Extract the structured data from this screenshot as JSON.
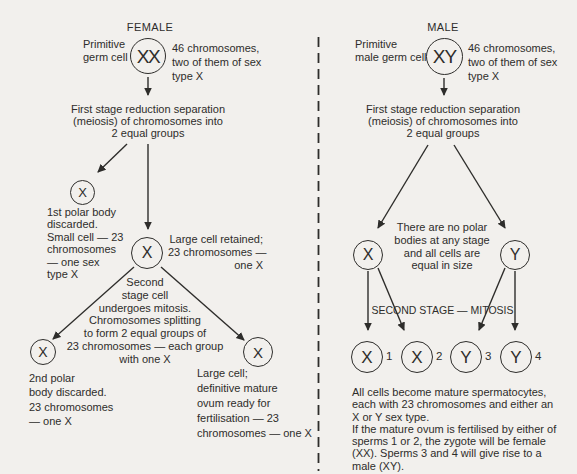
{
  "colors": {
    "ink": "#2e2d2b",
    "background": "#f2f0ed"
  },
  "female": {
    "title": "FEMALE",
    "primitive_label": "Primitive\ngerm cell",
    "germ_cell": "XX",
    "germ_note": "46 chromosomes,\ntwo of them of sex\ntype X",
    "first_stage": "First stage reduction separation\n(meiosis) of chromosomes into\n2 equal groups",
    "polar_body_1": {
      "symbol": "X",
      "note": "1st polar body\ndiscarded.\nSmall cell — 23\nchromosomes\n— one sex\ntype X"
    },
    "large_cell": {
      "symbol": "X",
      "note": "Large cell retained;\n23 chromosomes —\none X"
    },
    "second_stage": "Second\nstage cell\nundergoes mitosis.\nChromosomes splitting\nto form 2 equal groups of\n23 chromosomes — each group\nwith one X",
    "polar_body_2": {
      "symbol": "X",
      "note": "2nd polar\nbody discarded.\n23 chromosomes\n— one X"
    },
    "ovum": {
      "symbol": "X",
      "note": "Large cell;\ndefinitive mature\novum ready for\nfertilisation — 23\nchromosomes — one X"
    }
  },
  "male": {
    "title": "MALE",
    "primitive_label": "Primitive\nmale germ cell",
    "germ_cell": "XY",
    "germ_note": "46 chromosomes,\ntwo of them of sex\ntype X",
    "first_stage": "First stage reduction separation\n(meiosis) of chromosomes into\n2 equal groups",
    "x_cell": "X",
    "y_cell": "Y",
    "no_polar_note": "There are no polar\nbodies at any stage\nand all cells are\nequal in size",
    "second_stage_label": "SECOND STAGE — MITOSIS",
    "sperm_cells": [
      {
        "symbol": "X",
        "number": "1"
      },
      {
        "symbol": "X",
        "number": "2"
      },
      {
        "symbol": "Y",
        "number": "3"
      },
      {
        "symbol": "Y",
        "number": "4"
      }
    ],
    "bottom_note": "All cells become mature spermatocytes,\neach with 23 chromosomes and either an\nX or Y sex type.\nIf the mature ovum is fertilised by either of\nsperms 1 or 2, the zygote will be female\n(XX). Sperms 3 and 4 will give rise to a\nmale (XY)."
  }
}
